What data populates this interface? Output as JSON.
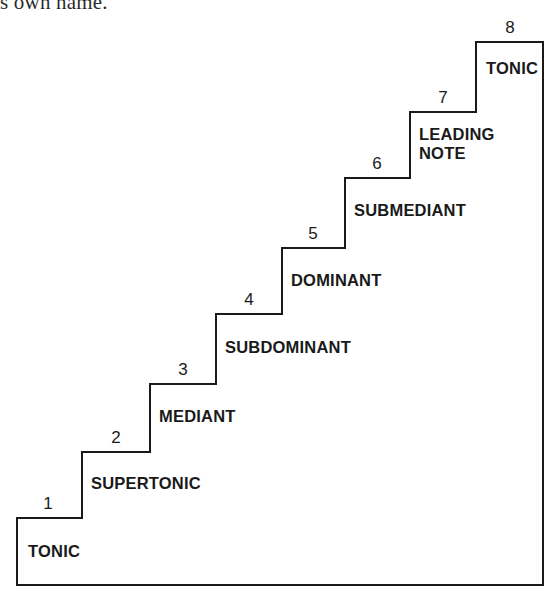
{
  "page": {
    "running_text": "s own name.",
    "background_color": "#ffffff",
    "ink_color": "#1a1a1a"
  },
  "diagram": {
    "name": "scale-degrees-staircase",
    "type": "staircase",
    "stroke_color": "#1a1a1a",
    "stroke_width": 2,
    "fill": "none",
    "outline": {
      "left_x": 17,
      "bottom_y": 585,
      "right_x": 543,
      "top_y": 42
    },
    "steps": [
      {
        "number": "1",
        "label": "TONIC",
        "tread_y": 518,
        "riser_x": 82,
        "number_x": 48,
        "number_y": 495,
        "label_x": 28,
        "label_y": 542
      },
      {
        "number": "2",
        "label": "SUPERTONIC",
        "tread_y": 452,
        "riser_x": 150,
        "number_x": 116,
        "number_y": 429,
        "label_x": 91,
        "label_y": 474
      },
      {
        "number": "3",
        "label": "MEDIANT",
        "tread_y": 384,
        "riser_x": 216,
        "number_x": 183,
        "number_y": 361,
        "label_x": 159,
        "label_y": 407
      },
      {
        "number": "4",
        "label": "SUBDOMINANT",
        "tread_y": 314,
        "riser_x": 282,
        "number_x": 249,
        "number_y": 291,
        "label_x": 225,
        "label_y": 338
      },
      {
        "number": "5",
        "label": "DOMINANT",
        "tread_y": 248,
        "riser_x": 345,
        "number_x": 313,
        "number_y": 225,
        "label_x": 291,
        "label_y": 271
      },
      {
        "number": "6",
        "label": "SUBMEDIANT",
        "tread_y": 178,
        "riser_x": 410,
        "number_x": 377,
        "number_y": 155,
        "label_x": 354,
        "label_y": 201
      },
      {
        "number": "7",
        "label": "LEADING\nNOTE",
        "tread_y": 112,
        "riser_x": 476,
        "number_x": 443,
        "number_y": 89,
        "label_x": 419,
        "label_y": 125
      },
      {
        "number": "8",
        "label": "TONIC",
        "tread_y": 42,
        "riser_x": 543,
        "number_x": 510,
        "number_y": 19,
        "label_x": 486,
        "label_y": 59
      }
    ],
    "path_d": "M 17 585 L 17 518 L 82 518 L 82 452 L 150 452 L 150 384 L 216 384 L 216 314 L 282 314 L 282 248 L 345 248 L 345 178 L 410 178 L 410 112 L 476 112 L 476 42 L 543 42 L 543 585 Z"
  }
}
